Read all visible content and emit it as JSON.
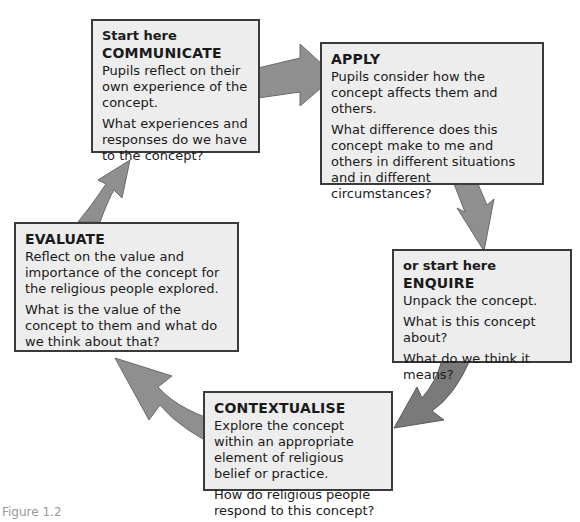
{
  "diagram": {
    "type": "cycle",
    "arrow_color": "#8f8f8f",
    "box_fill": "#ededed",
    "box_border": "#3a3a3a",
    "stages": [
      {
        "id": "communicate",
        "pre": "Start here",
        "title": "COMMUNICATE",
        "paragraphs": [
          "Pupils reflect on their own experience of the concept.",
          "What experiences and responses do we have to the concept?"
        ]
      },
      {
        "id": "apply",
        "title": "APPLY",
        "paragraphs": [
          "Pupils consider how the concept affects them and others.",
          "What difference does this concept make to me and others in different situations and in different circumstances?"
        ]
      },
      {
        "id": "enquire",
        "pre": "or start here",
        "title": "ENQUIRE",
        "paragraphs": [
          "Unpack the concept.",
          "What is this concept about?",
          "What do we think it means?"
        ]
      },
      {
        "id": "contextualise",
        "title": "CONTEXTUALISE",
        "paragraphs": [
          "Explore the concept within an appropriate element of religious belief or practice.",
          "How do religious people respond to this concept?"
        ]
      },
      {
        "id": "evaluate",
        "title": "EVALUATE",
        "paragraphs": [
          "Reflect on the value and importance of the concept for the religious people explored.",
          "What is the value of the concept to them and what do we think about that?"
        ]
      }
    ],
    "flow": [
      "communicate",
      "apply",
      "enquire",
      "contextualise",
      "evaluate",
      "communicate"
    ]
  },
  "caption": "Figure 1.2"
}
